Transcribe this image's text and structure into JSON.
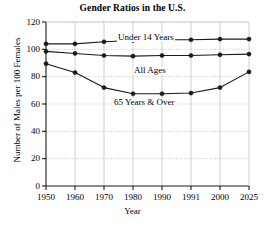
{
  "chart_data": {
    "type": "line",
    "title": "Gender Ratios in the U.S.",
    "xlabel": "Year",
    "ylabel": "Number of Males per 100 Females",
    "categories": [
      "1950",
      "1960",
      "1970",
      "1980",
      "1990",
      "1991",
      "2000",
      "2025"
    ],
    "x_tick_labels": [
      "1950",
      "1960",
      "1970",
      "1980",
      "1990",
      "1991",
      "2000",
      "2025"
    ],
    "y_tick_labels": [
      "0",
      "20",
      "40",
      "60",
      "80",
      "100",
      "120"
    ],
    "y_ticks": [
      0,
      20,
      40,
      60,
      80,
      100,
      120
    ],
    "ylim": [
      0,
      120
    ],
    "grid": "dotted-horizontal-and-vertical",
    "legend_position": "inline-labels",
    "marker": "filled-circle",
    "line_color": "#1a1a1a",
    "series": [
      {
        "name": "Under 14 Years",
        "label": "Under 14 Years",
        "values": [
          104,
          104,
          105.5,
          106.5,
          107,
          107,
          107.5,
          107.5
        ]
      },
      {
        "name": "All Ages",
        "label": "All Ages",
        "values": [
          98.5,
          97,
          95.5,
          95,
          95.5,
          95.5,
          96,
          96.5
        ]
      },
      {
        "name": "65 Years & Over",
        "label": "65 Years & Over",
        "values": [
          89.5,
          83,
          72,
          67.5,
          67.5,
          68,
          72,
          83.5
        ]
      }
    ]
  }
}
